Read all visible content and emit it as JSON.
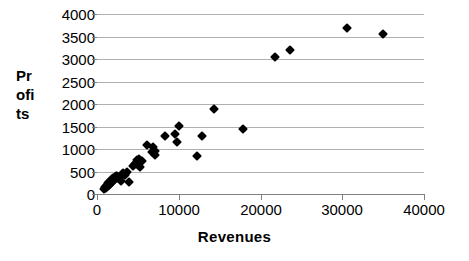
{
  "chart_data": {
    "type": "scatter",
    "title": "",
    "xlabel": "Revenues",
    "ylabel": "Profits",
    "ylabel_lines": [
      "Pr",
      "ofi",
      "ts"
    ],
    "xlim": [
      0,
      40000
    ],
    "ylim": [
      0,
      4000
    ],
    "xticks": [
      0,
      10000,
      20000,
      30000,
      40000
    ],
    "xtick_labels": [
      "0",
      "10000",
      "20000",
      "30000",
      "40000"
    ],
    "yticks": [
      0,
      500,
      1000,
      1500,
      2000,
      2500,
      3000,
      3500,
      4000
    ],
    "ytick_labels": [
      "0",
      "500",
      "1000",
      "1500",
      "2000",
      "2500",
      "3000",
      "3500",
      "4000"
    ],
    "grid": "horizontal",
    "legend": "none",
    "marker": "filled-diamond",
    "marker_color": "#000000",
    "points": [
      [
        900,
        110
      ],
      [
        1000,
        150
      ],
      [
        1150,
        130
      ],
      [
        1200,
        195
      ],
      [
        1300,
        170
      ],
      [
        1350,
        240
      ],
      [
        1450,
        210
      ],
      [
        1500,
        265
      ],
      [
        1600,
        230
      ],
      [
        1700,
        300
      ],
      [
        1750,
        255
      ],
      [
        1850,
        330
      ],
      [
        1900,
        285
      ],
      [
        2000,
        350
      ],
      [
        2050,
        310
      ],
      [
        2150,
        375
      ],
      [
        2200,
        330
      ],
      [
        2300,
        390
      ],
      [
        2400,
        355
      ],
      [
        2500,
        400
      ],
      [
        2600,
        370
      ],
      [
        2750,
        345
      ],
      [
        2900,
        300
      ],
      [
        3050,
        420
      ],
      [
        3200,
        460
      ],
      [
        3400,
        430
      ],
      [
        3650,
        490
      ],
      [
        3900,
        265
      ],
      [
        4400,
        620
      ],
      [
        4700,
        660
      ],
      [
        4800,
        700
      ],
      [
        4950,
        760
      ],
      [
        5050,
        640
      ],
      [
        5150,
        780
      ],
      [
        5300,
        610
      ],
      [
        5450,
        740
      ],
      [
        6100,
        1090
      ],
      [
        6700,
        930
      ],
      [
        6900,
        1040
      ],
      [
        7050,
        870
      ],
      [
        7150,
        960
      ],
      [
        8300,
        1280
      ],
      [
        9600,
        1330
      ],
      [
        9750,
        1145
      ],
      [
        10050,
        1520
      ],
      [
        12200,
        855
      ],
      [
        12900,
        1300
      ],
      [
        14350,
        1890
      ],
      [
        17800,
        1450
      ],
      [
        21800,
        3055
      ],
      [
        23600,
        3195
      ],
      [
        30550,
        3690
      ],
      [
        34950,
        3565
      ]
    ]
  }
}
